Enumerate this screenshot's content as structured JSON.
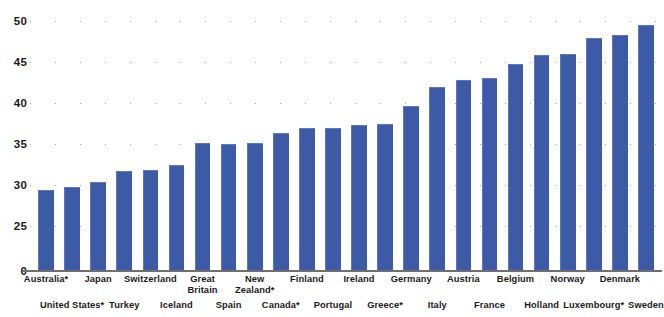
{
  "chart_data": {
    "type": "bar",
    "title": "",
    "subtitle": "",
    "xlabel": "",
    "ylabel": "",
    "ylim": [
      0,
      50
    ],
    "grid": true,
    "grid_style": "dotted",
    "legend": "none",
    "axis_note": "broken y-axis: 0 then 25 to 50 in steps of 5",
    "bar_color": "#3c5aa6",
    "y_ticks": [
      0,
      25,
      30,
      35,
      40,
      45,
      50
    ],
    "y_tick_labels": [
      "0",
      "25",
      "30",
      "35",
      "40",
      "45",
      "50"
    ],
    "categories": [
      "Australia*",
      "United States*",
      "Japan",
      "Turkey",
      "Switzerland",
      "Iceland",
      "Great Britain",
      "Spain",
      "New Zealand*",
      "Canada*",
      "Finland",
      "Portugal",
      "Ireland",
      "Greece*",
      "Germany",
      "Italy",
      "Austria",
      "France",
      "Belgium",
      "Holland",
      "Norway",
      "Luxembourg*",
      "Denmark",
      "Sweden"
    ],
    "values": [
      29.4,
      29.8,
      30.4,
      31.7,
      31.8,
      32.5,
      35.1,
      35.0,
      35.1,
      36.4,
      37.0,
      37.0,
      37.3,
      37.5,
      39.6,
      42.0,
      42.8,
      43.0,
      44.8,
      45.9,
      46.0,
      47.9,
      48.3,
      49.5
    ]
  },
  "x_label_rows": [
    "top",
    "bottom",
    "top",
    "bottom",
    "top",
    "bottom",
    "top",
    "bottom",
    "top",
    "bottom",
    "top",
    "bottom",
    "top",
    "bottom",
    "top",
    "bottom",
    "top",
    "bottom",
    "top",
    "bottom",
    "top",
    "bottom",
    "top",
    "bottom"
  ]
}
